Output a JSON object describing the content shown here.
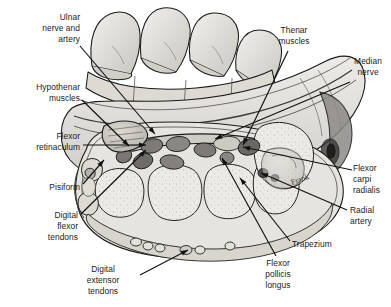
{
  "figure": {
    "style": "pen-and-ink anatomical line drawing with grey wash shading",
    "signature": "Frank",
    "colors": {
      "background": "#ffffff",
      "ink": "#1b1b1b",
      "bone_fill": "#e8e6e1",
      "muscle_fill": "#c9c6c0",
      "tendon_fill": "#8d8a86",
      "vessel_fill": "#6f6c68",
      "skin_fill": "#d9d7d2",
      "label_text": "#1b1b1b",
      "leader_line": "#111111"
    }
  },
  "labels": [
    {
      "id": "ulnar-nerve-and-artery",
      "text": "Ulnar\nnerve and\nartery",
      "align": "right",
      "x": 18,
      "y": 12,
      "w": 62,
      "leader": {
        "x1": 80,
        "y1": 46,
        "x2": 155,
        "y2": 134
      }
    },
    {
      "id": "hypothenar-muscles",
      "text": "Hypothenar\nmuscles",
      "align": "right",
      "x": 10,
      "y": 82,
      "w": 70,
      "leader": {
        "x1": 82,
        "y1": 100,
        "x2": 129,
        "y2": 146
      }
    },
    {
      "id": "flexor-retinaculum",
      "text": "Flexor\nretinaculum",
      "align": "right",
      "x": 8,
      "y": 131,
      "w": 72,
      "leader": {
        "x1": 83,
        "y1": 145,
        "x2": 146,
        "y2": 145
      }
    },
    {
      "id": "pisiform",
      "text": "Pisiform",
      "align": "right",
      "x": 10,
      "y": 182,
      "w": 70,
      "leader": {
        "x1": 83,
        "y1": 184,
        "x2": 104,
        "y2": 160
      }
    },
    {
      "id": "digital-flexor-tendons",
      "text": "Digital\nflexor\ntendons",
      "align": "right",
      "x": 12,
      "y": 210,
      "w": 66,
      "leader": {
        "x1": 81,
        "y1": 214,
        "x2": 146,
        "y2": 150
      }
    },
    {
      "id": "digital-extensor-tendons",
      "text": "Digital\nextensor\ntendons",
      "align": "center",
      "x": 70,
      "y": 264,
      "w": 66,
      "leader": {
        "x1": 140,
        "y1": 275,
        "x2": 188,
        "y2": 250
      }
    },
    {
      "id": "thenar-muscles",
      "text": "Thenar\nmuscles",
      "align": "center",
      "x": 263,
      "y": 25,
      "w": 62,
      "leader": {
        "x1": 288,
        "y1": 51,
        "x2": 243,
        "y2": 145
      }
    },
    {
      "id": "median-nerve",
      "text": "Median\nnerve",
      "align": "center",
      "x": 346,
      "y": 56,
      "w": 44,
      "leader": {
        "x1": 350,
        "y1": 82,
        "x2": 215,
        "y2": 139
      }
    },
    {
      "id": "flexor-carpi-radialis",
      "text": "Flexor\ncarpi\nradialis",
      "align": "left",
      "x": 353,
      "y": 163,
      "w": 38,
      "leader": {
        "x1": 352,
        "y1": 170,
        "x2": 243,
        "y2": 147
      }
    },
    {
      "id": "radial-artery",
      "text": "Radial\nartery",
      "align": "left",
      "x": 350,
      "y": 205,
      "w": 40,
      "leader": {
        "x1": 347,
        "y1": 210,
        "x2": 261,
        "y2": 173
      }
    },
    {
      "id": "trapezium",
      "text": "Trapezium",
      "align": "left",
      "x": 292,
      "y": 239,
      "w": 56,
      "leader": {
        "x1": 290,
        "y1": 241,
        "x2": 240,
        "y2": 178
      }
    },
    {
      "id": "flexor-pollicis-longus",
      "text": "Flexor\npollicis\nlongus",
      "align": "center",
      "x": 248,
      "y": 258,
      "w": 60,
      "leader": {
        "x1": 276,
        "y1": 256,
        "x2": 222,
        "y2": 158
      }
    }
  ]
}
